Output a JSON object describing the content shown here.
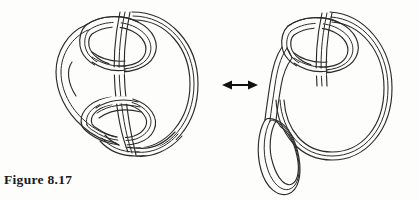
{
  "figure": {
    "caption": "Figure 8.17",
    "background_color": "#fdfdfc",
    "line_color": "#2b2b2b",
    "arrow_color": "#111111",
    "caption_color": "#1a1a1a"
  },
  "relation": {
    "symbol": "↔",
    "name": "double-headed-equivalence-arrow",
    "label": "is equivalent to",
    "x_start": 222,
    "x_end": 258,
    "y": 85
  },
  "diagrams": [
    {
      "id": "left-knot-diagram",
      "name": "ribbon-knot-before",
      "label": "Ribbon surface with two linked bands and a clasped outer band",
      "bounds": {
        "x": 55,
        "y": 8,
        "width": 146,
        "height": 152
      },
      "components": [
        {
          "name": "outer-large-band-loop",
          "label": "outer large band loop"
        },
        {
          "name": "upper-small-band-loop",
          "label": "upper small band loop"
        },
        {
          "name": "lower-small-band-loop",
          "label": "lower small band loop"
        },
        {
          "name": "left-cusp-band",
          "label": "left pointed cusp band"
        },
        {
          "name": "vertical-crossing-band",
          "label": "central vertical band passing through both loops"
        }
      ]
    },
    {
      "id": "right-knot-diagram",
      "name": "ribbon-knot-after",
      "label": "Ribbon surface after isotopy, with pendant loop hanging free",
      "bounds": {
        "x": 258,
        "y": 8,
        "width": 136,
        "height": 190
      },
      "components": [
        {
          "name": "outer-large-band-loop",
          "label": "outer large band loop"
        },
        {
          "name": "upper-small-band-loop",
          "label": "upper small band loop"
        },
        {
          "name": "pendant-oval-loop",
          "label": "pendant hanging oval loop"
        },
        {
          "name": "connecting-band-stem",
          "label": "connecting band stem"
        }
      ]
    }
  ]
}
